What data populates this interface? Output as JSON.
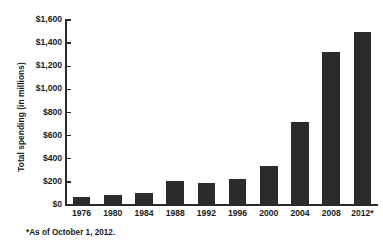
{
  "chart_data": {
    "type": "bar",
    "title": "",
    "xlabel": "",
    "ylabel": "Total spending (in millions)",
    "categories": [
      "1976",
      "1980",
      "1984",
      "1988",
      "1992",
      "1996",
      "2000",
      "2004",
      "2008",
      "2012*"
    ],
    "values": [
      65,
      90,
      105,
      210,
      190,
      225,
      340,
      715,
      1320,
      1500
    ],
    "ylim": [
      0,
      1600
    ],
    "ytick_values": [
      0,
      200,
      400,
      600,
      800,
      1000,
      1200,
      1400,
      1600
    ],
    "ytick_labels": [
      "$0",
      "$200",
      "$400",
      "$600",
      "$800",
      "$1,000",
      "$1,200",
      "$1,400",
      "$1,600"
    ],
    "grid": false,
    "legend": null,
    "bar_color": "#2b2b2b",
    "background_color": "#ffffff",
    "annotations": [
      "*As of October 1, 2012."
    ]
  },
  "footnote": "*As of October 1, 2012."
}
